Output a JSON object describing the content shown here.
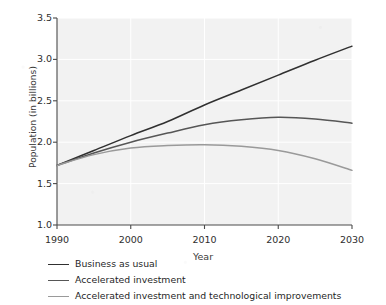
{
  "chart_data": {
    "type": "line",
    "title": "",
    "xlabel": "Year",
    "ylabel": "Population (in billions)",
    "xlim": [
      1990,
      2030
    ],
    "ylim": [
      1.0,
      3.5
    ],
    "xticks": [
      1990,
      2000,
      2010,
      2020,
      2030
    ],
    "xtick_labels": [
      "1990",
      "2000",
      "2010",
      "2020",
      "2030"
    ],
    "yticks": [
      1.0,
      1.5,
      2.0,
      2.5,
      3.0,
      3.5
    ],
    "ytick_labels": [
      "1.0",
      "1.5",
      "2.0",
      "2.5",
      "3.0",
      "3.5"
    ],
    "grid": true,
    "legend_position": "below-axes-left",
    "plot_bgcolor": "#f2f2f2",
    "gridcolor": "#ffffff",
    "x": [
      1990,
      1995,
      2000,
      2005,
      2010,
      2015,
      2020,
      2025,
      2030
    ],
    "series": [
      {
        "name": "Business as usual",
        "color": "#303030",
        "values": [
          1.72,
          1.9,
          2.08,
          2.25,
          2.45,
          2.63,
          2.81,
          2.99,
          3.16
        ]
      },
      {
        "name": "Accelerated investment",
        "color": "#565656",
        "values": [
          1.72,
          1.87,
          2.0,
          2.11,
          2.21,
          2.27,
          2.3,
          2.28,
          2.23
        ]
      },
      {
        "name": "Accelerated investment and technological improvements",
        "color": "#9a9a9a",
        "values": [
          1.72,
          1.85,
          1.93,
          1.96,
          1.97,
          1.95,
          1.9,
          1.8,
          1.66
        ]
      }
    ]
  },
  "axes": {
    "y_title": "Population (in billions)",
    "x_title": "Year"
  },
  "legend": {
    "items": [
      {
        "label": "Business as usual",
        "color": "#303030"
      },
      {
        "label": "Accelerated investment",
        "color": "#565656"
      },
      {
        "label": "Accelerated investment and technological improvements",
        "color": "#9a9a9a"
      }
    ]
  }
}
